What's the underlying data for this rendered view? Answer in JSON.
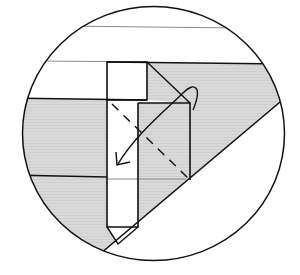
{
  "diagram": {
    "type": "origami-instruction",
    "colors": {
      "background": "#ffffff",
      "paper_shaded": "#d6d6d6",
      "paper_white": "#ffffff",
      "line": "#111111",
      "thin_line": "#8a8a8a"
    },
    "elements": [
      {
        "id": "detail-circle",
        "kind": "circle-frame"
      },
      {
        "id": "shaded-region",
        "kind": "colored-side-of-paper"
      },
      {
        "id": "white-strip",
        "kind": "white-side-strip"
      },
      {
        "id": "upper-square",
        "kind": "white-flap"
      },
      {
        "id": "right-square",
        "kind": "flap-to-fold"
      },
      {
        "id": "valley-fold-dashed",
        "kind": "dashed-fold-line",
        "from": "top-left",
        "to": "bottom-right"
      },
      {
        "id": "fold-arrow",
        "kind": "curved-arrow",
        "direction": "fold flap down-left across the diagonal"
      },
      {
        "id": "diagonal-edge",
        "kind": "paper-edge"
      },
      {
        "id": "pointed-tip",
        "kind": "strip-point"
      }
    ],
    "caption": "Fold the flap along the dashed diagonal in the direction of the arrow"
  }
}
